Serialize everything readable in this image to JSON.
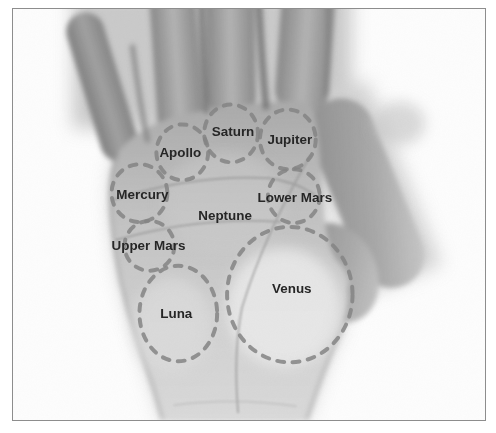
{
  "figure": {
    "type": "palmistry-hand-diagram"
  },
  "colors": {
    "background": "#ffffff",
    "frame_border": "#8d8d8d",
    "dash": "#848484",
    "label_text": "#262626"
  },
  "mounts": [
    {
      "id": "apollo",
      "label": "Apollo",
      "circle": {
        "cx": 170,
        "cy": 144,
        "rx": 26,
        "ry": 28
      },
      "label_x": 168,
      "label_y": 149
    },
    {
      "id": "saturn",
      "label": "Saturn",
      "circle": {
        "cx": 219,
        "cy": 125,
        "rx": 27,
        "ry": 29
      },
      "label_x": 221,
      "label_y": 128
    },
    {
      "id": "jupiter",
      "label": "Jupiter",
      "circle": {
        "cx": 276,
        "cy": 131,
        "rx": 28,
        "ry": 30
      },
      "label_x": 278,
      "label_y": 136
    },
    {
      "id": "mercury",
      "label": "Mercury",
      "circle": {
        "cx": 127,
        "cy": 185,
        "rx": 28,
        "ry": 29
      },
      "label_x": 130,
      "label_y": 191
    },
    {
      "id": "lower-mars",
      "label": "Lower Mars",
      "circle": {
        "cx": 282,
        "cy": 188,
        "rx": 26,
        "ry": 27
      },
      "label_x": 283,
      "label_y": 194
    },
    {
      "id": "neptune",
      "label": "Neptune",
      "circle": null,
      "label_x": 213,
      "label_y": 212
    },
    {
      "id": "upper-mars",
      "label": "Upper Mars",
      "circle": {
        "cx": 137,
        "cy": 238,
        "rx": 25,
        "ry": 25
      },
      "label_x": 136,
      "label_y": 242
    },
    {
      "id": "luna",
      "label": "Luna",
      "circle": {
        "cx": 166,
        "cy": 306,
        "rx": 39,
        "ry": 48
      },
      "label_x": 164,
      "label_y": 311
    },
    {
      "id": "venus",
      "label": "Venus",
      "circle": {
        "cx": 278,
        "cy": 287,
        "rx": 63,
        "ry": 68
      },
      "label_x": 280,
      "label_y": 285
    }
  ]
}
